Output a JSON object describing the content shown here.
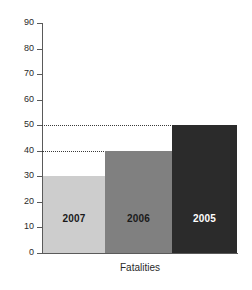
{
  "chart_data": {
    "type": "bar",
    "title": "",
    "xlabel": "Fatalities",
    "ylabel": "",
    "categories": [
      "2007",
      "2006",
      "2005"
    ],
    "values": [
      30,
      40,
      50
    ],
    "ylim": [
      0,
      90
    ],
    "y_ticks": [
      0,
      10,
      20,
      30,
      40,
      50,
      60,
      70,
      80,
      90
    ],
    "y_tick_labels": [
      "0",
      "10",
      "20",
      "30",
      "40",
      "50",
      "60",
      "70",
      "80",
      "90"
    ],
    "grid": false,
    "legend": "none",
    "bar_labels": [
      "2007",
      "2006",
      "2005"
    ],
    "bar_colors": [
      "#cdcdcd",
      "#808080",
      "#2b2b2b"
    ],
    "bar_label_colors": [
      "#1a1a1a",
      "#1a1a1a",
      "#ffffff"
    ],
    "leader_lines": [
      50,
      40
    ],
    "series": [
      {
        "name": "Fatalities",
        "values": [
          30,
          40,
          50
        ]
      }
    ]
  },
  "axis": {
    "line_color": "#5a5a5a"
  }
}
